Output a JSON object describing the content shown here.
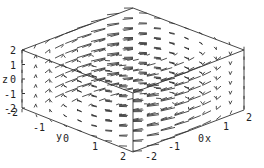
{
  "chart_data": {
    "type": "vector_field_3d",
    "title": "",
    "xlabel": "x",
    "ylabel": "y",
    "zlabel": "z",
    "x_ticks": [
      "-2",
      "-1",
      "0",
      "1",
      "2"
    ],
    "y_ticks": [
      "-2",
      "-1",
      "0",
      "1",
      "2"
    ],
    "z_ticks": [
      "-2",
      "-1",
      "0",
      "1",
      "2"
    ],
    "xlim": [
      -2,
      2
    ],
    "ylim": [
      -2,
      2
    ],
    "zlim": [
      -2,
      2
    ],
    "grid": false,
    "box": true
  },
  "colors": {
    "stroke": "#222222",
    "background": "#ffffff"
  }
}
